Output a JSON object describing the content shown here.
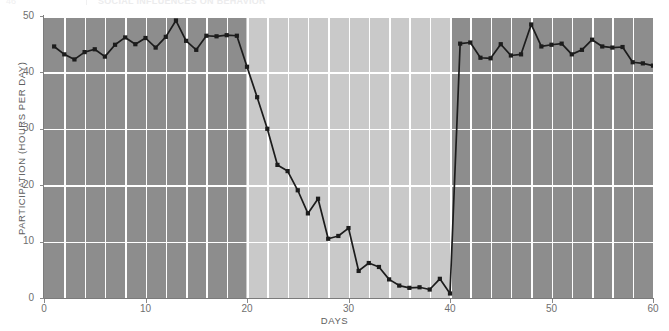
{
  "header": {
    "number": "46",
    "divider": "|",
    "title": "SOCIAL INFLUENCES ON BEHAVIOR"
  },
  "chart_data": {
    "type": "line",
    "title": "",
    "subtitle": "",
    "xlabel": "DAYS",
    "ylabel": "PARTICIPATION (HOURS PER DAY)",
    "xlim": [
      0,
      60
    ],
    "ylim": [
      0,
      50
    ],
    "xticks": [
      0,
      10,
      20,
      30,
      40,
      50,
      60
    ],
    "yticks": [
      0,
      10,
      20,
      30,
      40,
      50
    ],
    "xtick_labels": [
      "0",
      "10",
      "20",
      "30",
      "40",
      "50",
      "60"
    ],
    "ytick_labels": [
      "0",
      "10",
      "20",
      "30",
      "40",
      "50"
    ],
    "grid": "vertical-every-2-days-and-horizontal-every-10-units",
    "legend": "none",
    "line_color": "#1c1c1c",
    "marker": "square",
    "marker_color": "#1c1c1c",
    "background_bands": [
      {
        "name": "baseline-1",
        "x_start": 0,
        "x_end": 19.9,
        "color": "#8d8d8d",
        "label": ""
      },
      {
        "name": "intervention",
        "x_start": 19.9,
        "x_end": 40.0,
        "color": "#c9c9c9",
        "label": ""
      },
      {
        "name": "baseline-2",
        "x_start": 40.0,
        "x_end": 60,
        "color": "#8d8d8d",
        "label": ""
      }
    ],
    "x": [
      1,
      2,
      3,
      4,
      5,
      6,
      7,
      8,
      9,
      10,
      11,
      12,
      13,
      14,
      15,
      16,
      17,
      18,
      19,
      20,
      21,
      22,
      23,
      24,
      25,
      26,
      27,
      28,
      29,
      30,
      31,
      32,
      33,
      34,
      35,
      36,
      37,
      38,
      39,
      40,
      41,
      42,
      43,
      44,
      45,
      46,
      47,
      48,
      49,
      50,
      51,
      52,
      53,
      54,
      55,
      56,
      57,
      58,
      59,
      60
    ],
    "y": [
      44.6,
      43.2,
      42.3,
      43.6,
      44.1,
      42.8,
      44.9,
      46.2,
      45.0,
      46.1,
      44.4,
      46.3,
      49.2,
      45.6,
      44.0,
      46.5,
      46.4,
      46.6,
      46.5,
      41.0,
      35.6,
      30.0,
      23.6,
      22.5,
      19.1,
      15.0,
      17.6,
      10.5,
      11.0,
      12.4,
      4.8,
      6.2,
      5.5,
      3.3,
      2.2,
      1.8,
      1.9,
      1.5,
      3.4,
      0.8,
      45.1,
      45.3,
      42.6,
      42.5,
      45.0,
      43.0,
      43.2,
      48.5,
      44.6,
      44.9,
      45.1,
      43.2,
      44.0,
      45.8,
      44.6,
      44.4,
      44.5,
      41.8,
      41.6,
      41.2
    ],
    "series": [
      {
        "name": "participation",
        "values": [
          44.6,
          43.2,
          42.3,
          43.6,
          44.1,
          42.8,
          44.9,
          46.2,
          45.0,
          46.1,
          44.4,
          46.3,
          49.2,
          45.6,
          44.0,
          46.5,
          46.4,
          46.6,
          46.5,
          41.0,
          35.6,
          30.0,
          23.6,
          22.5,
          19.1,
          15.0,
          17.6,
          10.5,
          11.0,
          12.4,
          4.8,
          6.2,
          5.5,
          3.3,
          2.2,
          1.8,
          1.9,
          1.5,
          3.4,
          0.8,
          45.1,
          45.3,
          42.6,
          42.5,
          45.0,
          43.0,
          43.2,
          48.5,
          44.6,
          44.9,
          45.1,
          43.2,
          44.0,
          45.8,
          44.6,
          44.4,
          44.5,
          41.8,
          41.6,
          41.2
        ]
      }
    ]
  },
  "colors": {
    "band_dark": "#8d8d8d",
    "band_light": "#c9c9c9",
    "gridline": "#ffffff",
    "axis": "#7b7b7b",
    "line": "#1c1c1c",
    "tick_text": "#6f6f6f",
    "axis_label_text": "#5e5e5e"
  }
}
